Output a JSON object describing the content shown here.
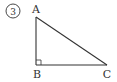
{
  "problem": {
    "number_label": "3",
    "number_style": "circled"
  },
  "figure": {
    "type": "right-triangle",
    "vertices": [
      {
        "name": "A",
        "x": 36,
        "y": 17
      },
      {
        "name": "B",
        "x": 36,
        "y": 65
      },
      {
        "name": "C",
        "x": 107,
        "y": 65
      }
    ],
    "right_angle_at": "B",
    "labels": {
      "A": "A",
      "B": "B",
      "C": "C"
    },
    "stroke_color": "#333333"
  }
}
